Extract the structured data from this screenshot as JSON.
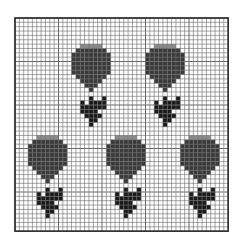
{
  "pattern": {
    "title": "",
    "type": "cross-stitch chart",
    "grid": {
      "left": 15,
      "top": 18,
      "cols": 49,
      "rows": 49,
      "cell": 4.35,
      "line_color": "#6a6a6a",
      "border_color": "#222222",
      "background": "#ffffff"
    },
    "colors": {
      "bloom": "#3a3a3a",
      "bloom_light": "#8a8a8a",
      "stem": "#1a1a1a"
    },
    "motif": {
      "name": "tulip",
      "bloom": [
        "..ooooo..",
        ".XXXXXXX.",
        "XXXXXXXXX",
        "XXXXXXXXX",
        "XXXXXXXXX",
        "XXXXXXXXX",
        "XXXXXXXXX",
        ".XXXXXXX.",
        "..XXXXX..",
        "...XXX...",
        "....X....",
        "........."
      ],
      "stem": [
        "....S..S.",
        "..S.SSSS.",
        "..SSSSSS.",
        "..SSSS...",
        "...SSSS..",
        "....SS...",
        "....S...."
      ]
    },
    "motifs": [
      {
        "name": "tulip-top-left",
        "col": 13,
        "row": 6
      },
      {
        "name": "tulip-top-right",
        "col": 30,
        "row": 6
      },
      {
        "name": "tulip-bottom-left",
        "col": 3,
        "row": 27
      },
      {
        "name": "tulip-bottom-center",
        "col": 21,
        "row": 27
      },
      {
        "name": "tulip-bottom-right",
        "col": 38,
        "row": 27
      }
    ]
  }
}
